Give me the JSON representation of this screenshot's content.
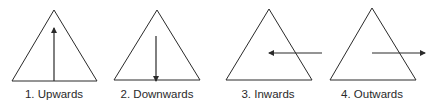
{
  "diagram": {
    "stroke_color": "#2a2a2a",
    "background": "#ffffff",
    "panels": [
      {
        "id": "upwards",
        "label": "1. Upwards",
        "direction": "up",
        "triangle": [
          [
            54,
            10
          ],
          [
            12,
            81
          ],
          [
            97,
            81
          ]
        ],
        "arrow": {
          "from": [
            54,
            81
          ],
          "to": [
            54,
            28
          ]
        },
        "label_x": 54
      },
      {
        "id": "downwards",
        "label": "2. Downwards",
        "direction": "down",
        "triangle": [
          [
            157,
            10
          ],
          [
            114,
            80
          ],
          [
            200,
            80
          ]
        ],
        "arrow": {
          "from": [
            156,
            36
          ],
          "to": [
            156,
            81
          ]
        },
        "label_x": 157
      },
      {
        "id": "inwards",
        "label": "3. Inwards",
        "direction": "in",
        "triangle": [
          [
            269,
            9
          ],
          [
            226,
            80
          ],
          [
            312,
            80
          ]
        ],
        "arrow": {
          "from": [
            322,
            53
          ],
          "to": [
            269,
            53
          ]
        },
        "label_x": 268
      },
      {
        "id": "outwards",
        "label": "4. Outwards",
        "direction": "out",
        "triangle": [
          [
            372,
            8
          ],
          [
            330,
            80
          ],
          [
            416,
            80
          ]
        ],
        "arrow": {
          "from": [
            372,
            53
          ],
          "to": [
            425,
            53
          ]
        },
        "label_x": 372
      }
    ]
  }
}
